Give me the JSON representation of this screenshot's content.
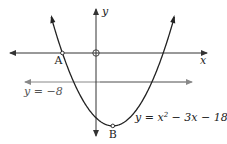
{
  "diagram": {
    "title": "",
    "axes": {
      "x_label": "x",
      "y_label": "y"
    },
    "curve": {
      "equation_label_prefix": "y = x",
      "equation_label_exp": "2",
      "equation_label_suffix": " − 3x − 18",
      "a": 1,
      "b": -3,
      "c": -18,
      "x_range": [
        -4.0,
        7.0
      ]
    },
    "line": {
      "label": "y = −8",
      "y_value": -8
    },
    "points": [
      {
        "name": "A",
        "x": -3,
        "y": 0
      },
      {
        "name": "B",
        "x": 1.5,
        "y": -20.25
      }
    ],
    "colors": {
      "curve": "#222222",
      "axes": "#333333",
      "line": "#888888"
    }
  }
}
